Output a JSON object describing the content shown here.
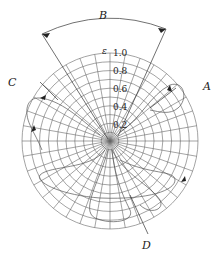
{
  "diagram": {
    "type": "polar-grid",
    "axis_label": "ε",
    "radial_ticks": [
      "0.2",
      "0.4",
      "0.6",
      "0.8",
      "1.0"
    ],
    "labels": {
      "A": "A",
      "B": "B",
      "C": "C",
      "D": "D"
    },
    "colors": {
      "line": "#444444",
      "grid": "#666666",
      "text": "#222222"
    }
  }
}
